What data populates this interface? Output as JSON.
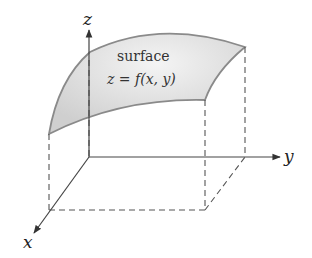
{
  "diagram": {
    "axes": {
      "x_label": "x",
      "y_label": "y",
      "z_label": "z"
    },
    "surface": {
      "label": "surface",
      "equation": "z = f(x, y)",
      "fill_color": "#d6d6d6",
      "edge_color": "#8a8a8a"
    },
    "colors": {
      "axis": "#444444",
      "dashed": "#555555",
      "background": "#ffffff"
    }
  }
}
